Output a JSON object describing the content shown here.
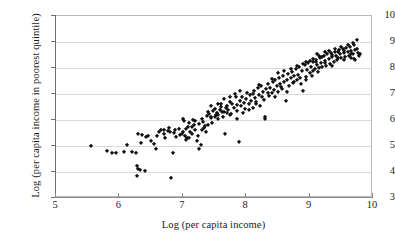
{
  "chart_data": {
    "type": "scatter",
    "title": "",
    "xlabel": "Log (per capita income)",
    "ylabel": "Log (per capita income in poorest quintile)",
    "xlim": [
      5,
      10
    ],
    "ylim": [
      3,
      10
    ],
    "xticks": [
      5,
      6,
      7,
      8,
      9,
      10
    ],
    "yticks": [
      3,
      4,
      5,
      6,
      7,
      8,
      9,
      10
    ],
    "grid": "horizontal",
    "legend": null,
    "marker": "diamond",
    "marker_color": "#121212",
    "gridline_color": "#d8d8d8",
    "axis_color": "#6f6f6f",
    "background_color": "#ffffff",
    "series": [
      {
        "name": "countries",
        "points": [
          [
            5.55,
            5.0
          ],
          [
            5.8,
            4.82
          ],
          [
            5.88,
            4.75
          ],
          [
            5.95,
            4.75
          ],
          [
            6.08,
            4.78
          ],
          [
            6.12,
            5.05
          ],
          [
            6.2,
            4.78
          ],
          [
            6.26,
            4.72
          ],
          [
            6.28,
            4.22
          ],
          [
            6.3,
            4.12
          ],
          [
            6.27,
            3.84
          ],
          [
            6.33,
            4.08
          ],
          [
            6.36,
            5.42
          ],
          [
            6.4,
            4.02
          ],
          [
            6.42,
            5.35
          ],
          [
            6.45,
            5.38
          ],
          [
            6.3,
            5.45
          ],
          [
            6.34,
            5.12
          ],
          [
            6.5,
            5.18
          ],
          [
            6.55,
            5.08
          ],
          [
            6.58,
            4.9
          ],
          [
            6.62,
            5.52
          ],
          [
            6.66,
            5.6
          ],
          [
            6.7,
            5.62
          ],
          [
            6.72,
            5.3
          ],
          [
            6.76,
            5.58
          ],
          [
            6.8,
            5.55
          ],
          [
            6.82,
            3.76
          ],
          [
            6.84,
            4.73
          ],
          [
            6.88,
            5.6
          ],
          [
            6.9,
            5.35
          ],
          [
            6.94,
            5.64
          ],
          [
            6.98,
            5.48
          ],
          [
            7.0,
            6.05
          ],
          [
            7.02,
            5.95
          ],
          [
            7.04,
            5.37
          ],
          [
            7.06,
            5.3
          ],
          [
            7.08,
            5.72
          ],
          [
            7.1,
            5.88
          ],
          [
            7.12,
            5.52
          ],
          [
            7.14,
            5.45
          ],
          [
            7.16,
            6.0
          ],
          [
            7.18,
            5.8
          ],
          [
            7.2,
            5.62
          ],
          [
            7.22,
            5.18
          ],
          [
            7.24,
            5.4
          ],
          [
            7.26,
            4.9
          ],
          [
            7.28,
            5.02
          ],
          [
            7.3,
            6.02
          ],
          [
            7.32,
            5.92
          ],
          [
            7.34,
            5.7
          ],
          [
            7.36,
            5.55
          ],
          [
            7.38,
            6.15
          ],
          [
            7.4,
            6.3
          ],
          [
            7.42,
            6.22
          ],
          [
            7.44,
            6.1
          ],
          [
            7.46,
            5.9
          ],
          [
            7.48,
            6.35
          ],
          [
            7.5,
            6.42
          ],
          [
            7.52,
            6.18
          ],
          [
            7.54,
            6.28
          ],
          [
            7.56,
            6.05
          ],
          [
            7.58,
            6.4
          ],
          [
            7.6,
            6.5
          ],
          [
            7.62,
            6.3
          ],
          [
            7.64,
            6.12
          ],
          [
            7.66,
            5.45
          ],
          [
            7.68,
            6.45
          ],
          [
            7.7,
            6.55
          ],
          [
            7.72,
            6.38
          ],
          [
            7.74,
            6.7
          ],
          [
            7.76,
            6.25
          ],
          [
            7.78,
            6.62
          ],
          [
            7.8,
            6.45
          ],
          [
            7.82,
            7.0
          ],
          [
            7.84,
            6.88
          ],
          [
            7.86,
            6.58
          ],
          [
            7.88,
            5.15
          ],
          [
            7.9,
            6.72
          ],
          [
            7.92,
            6.52
          ],
          [
            7.94,
            6.9
          ],
          [
            7.96,
            6.65
          ],
          [
            7.98,
            6.42
          ],
          [
            8.0,
            6.8
          ],
          [
            8.02,
            7.05
          ],
          [
            8.04,
            6.6
          ],
          [
            8.06,
            6.95
          ],
          [
            8.08,
            6.75
          ],
          [
            8.1,
            6.48
          ],
          [
            8.12,
            7.12
          ],
          [
            8.14,
            6.85
          ],
          [
            8.16,
            6.68
          ],
          [
            8.18,
            7.22
          ],
          [
            8.2,
            6.98
          ],
          [
            8.22,
            6.55
          ],
          [
            8.24,
            7.3
          ],
          [
            8.26,
            7.08
          ],
          [
            8.28,
            6.78
          ],
          [
            8.3,
            6.05
          ],
          [
            8.32,
            7.18
          ],
          [
            8.34,
            7.4
          ],
          [
            8.36,
            6.92
          ],
          [
            8.38,
            7.25
          ],
          [
            8.4,
            7.02
          ],
          [
            8.42,
            7.45
          ],
          [
            8.44,
            7.15
          ],
          [
            8.46,
            7.55
          ],
          [
            8.48,
            7.32
          ],
          [
            8.5,
            7.08
          ],
          [
            8.52,
            7.62
          ],
          [
            8.54,
            7.38
          ],
          [
            8.56,
            7.2
          ],
          [
            8.58,
            7.7
          ],
          [
            8.6,
            7.45
          ],
          [
            8.62,
            6.75
          ],
          [
            8.64,
            7.52
          ],
          [
            8.66,
            7.78
          ],
          [
            8.68,
            7.3
          ],
          [
            8.7,
            7.6
          ],
          [
            8.72,
            7.85
          ],
          [
            8.74,
            7.42
          ],
          [
            8.76,
            7.68
          ],
          [
            8.78,
            7.95
          ],
          [
            8.8,
            7.55
          ],
          [
            8.82,
            7.75
          ],
          [
            8.84,
            8.02
          ],
          [
            8.86,
            7.38
          ],
          [
            8.88,
            7.88
          ],
          [
            8.9,
            7.12
          ],
          [
            8.92,
            8.1
          ],
          [
            8.94,
            7.65
          ],
          [
            8.96,
            7.92
          ],
          [
            8.98,
            8.18
          ],
          [
            9.0,
            7.8
          ],
          [
            9.02,
            8.05
          ],
          [
            9.04,
            7.7
          ],
          [
            9.06,
            8.25
          ],
          [
            9.08,
            7.98
          ],
          [
            9.1,
            8.3
          ],
          [
            9.12,
            8.12
          ],
          [
            9.14,
            7.85
          ],
          [
            9.16,
            8.38
          ],
          [
            9.18,
            8.2
          ],
          [
            9.2,
            8.02
          ],
          [
            9.22,
            8.45
          ],
          [
            9.24,
            8.28
          ],
          [
            9.26,
            8.08
          ],
          [
            9.28,
            8.52
          ],
          [
            9.3,
            8.35
          ],
          [
            9.32,
            8.15
          ],
          [
            9.34,
            8.58
          ],
          [
            9.36,
            8.42
          ],
          [
            9.38,
            8.22
          ],
          [
            9.4,
            8.62
          ],
          [
            9.42,
            8.48
          ],
          [
            9.44,
            8.3
          ],
          [
            9.46,
            8.68
          ],
          [
            9.48,
            8.52
          ],
          [
            9.5,
            8.38
          ],
          [
            9.52,
            8.72
          ],
          [
            9.54,
            8.58
          ],
          [
            9.56,
            8.42
          ],
          [
            9.58,
            8.78
          ],
          [
            9.6,
            8.62
          ],
          [
            9.62,
            8.48
          ],
          [
            9.64,
            8.82
          ],
          [
            9.66,
            8.65
          ],
          [
            9.68,
            8.52
          ],
          [
            9.7,
            8.88
          ],
          [
            9.72,
            8.7
          ],
          [
            9.74,
            9.08
          ],
          [
            9.76,
            8.58
          ],
          [
            9.78,
            8.45
          ],
          [
            9.8,
            8.52
          ],
          [
            7.05,
            5.65
          ],
          [
            7.15,
            5.75
          ],
          [
            7.25,
            5.85
          ],
          [
            7.35,
            5.78
          ],
          [
            7.45,
            6.08
          ],
          [
            7.55,
            6.2
          ],
          [
            7.65,
            6.32
          ],
          [
            7.75,
            6.18
          ],
          [
            7.85,
            6.35
          ],
          [
            7.95,
            6.28
          ],
          [
            8.05,
            6.4
          ],
          [
            8.15,
            6.62
          ],
          [
            8.25,
            6.88
          ],
          [
            8.35,
            7.02
          ],
          [
            8.45,
            6.9
          ],
          [
            8.55,
            7.28
          ],
          [
            8.65,
            7.08
          ],
          [
            8.75,
            7.48
          ],
          [
            8.85,
            7.62
          ],
          [
            8.95,
            7.52
          ],
          [
            9.05,
            7.9
          ],
          [
            9.15,
            8.0
          ],
          [
            9.25,
            8.18
          ],
          [
            9.35,
            8.08
          ],
          [
            9.45,
            8.4
          ],
          [
            9.55,
            8.32
          ],
          [
            9.65,
            8.55
          ],
          [
            9.75,
            8.75
          ],
          [
            6.95,
            5.42
          ],
          [
            7.05,
            5.22
          ],
          [
            7.85,
            6.02
          ],
          [
            8.3,
            6.1
          ],
          [
            9.05,
            8.35
          ],
          [
            9.15,
            8.45
          ],
          [
            9.25,
            8.6
          ],
          [
            9.35,
            8.5
          ],
          [
            9.45,
            8.62
          ],
          [
            9.55,
            8.66
          ],
          [
            9.65,
            8.4
          ],
          [
            9.7,
            8.35
          ],
          [
            8.95,
            8.22
          ],
          [
            9.12,
            8.55
          ],
          [
            9.3,
            8.66
          ],
          [
            9.5,
            8.8
          ],
          [
            7.45,
            6.55
          ],
          [
            7.55,
            6.62
          ],
          [
            7.65,
            6.8
          ],
          [
            7.75,
            6.9
          ],
          [
            7.9,
            7.1
          ],
          [
            8.1,
            7.0
          ],
          [
            8.2,
            7.35
          ],
          [
            8.4,
            7.58
          ],
          [
            8.6,
            7.9
          ],
          [
            8.8,
            8.08
          ],
          [
            9.0,
            8.28
          ],
          [
            9.2,
            8.42
          ],
          [
            6.6,
            5.4
          ],
          [
            6.7,
            5.48
          ],
          [
            6.78,
            5.68
          ],
          [
            6.86,
            5.5
          ],
          [
            7.0,
            5.52
          ],
          [
            7.1,
            5.3
          ],
          [
            7.2,
            5.95
          ],
          [
            7.3,
            5.6
          ],
          [
            7.4,
            5.82
          ],
          [
            7.5,
            6.12
          ],
          [
            7.6,
            6.6
          ],
          [
            7.7,
            6.28
          ],
          [
            8.5,
            7.82
          ],
          [
            8.7,
            7.95
          ],
          [
            8.9,
            8.15
          ],
          [
            9.1,
            8.22
          ],
          [
            9.4,
            8.72
          ],
          [
            9.6,
            8.9
          ],
          [
            9.68,
            8.95
          ],
          [
            9.72,
            8.3
          ]
        ]
      }
    ]
  }
}
